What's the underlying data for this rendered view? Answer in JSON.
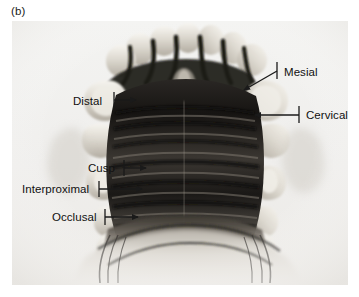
{
  "figure": {
    "panel_label": "(b)",
    "view_description": "occlusal view of dental arch specimen",
    "frame": {
      "x": 12,
      "y": 21,
      "width": 336,
      "height": 264,
      "background": "#f1f1ef"
    }
  },
  "colors": {
    "page_background": "#ffffff",
    "image_background": "#f1f1ef",
    "annotation_line": "#1a1a1a",
    "text": "#101010",
    "enamel_light": "#e8e5de",
    "enamel_mid": "#c8c3b8",
    "shadow_dark": "#1d1b18",
    "mid_tone": "#6e6a63"
  },
  "callouts": [
    {
      "id": "distal",
      "label": "Distal",
      "text_x": 73,
      "text_y": 95,
      "align": "left",
      "tick": {
        "x": 114,
        "y1": 92,
        "y2": 108
      },
      "arrow": {
        "x1": 114,
        "y1": 100,
        "x2": 142,
        "y2": 100
      },
      "arrow_direction": "right"
    },
    {
      "id": "mesial",
      "label": "Mesial",
      "text_x": 284,
      "text_y": 66,
      "align": "left",
      "tick": {
        "x": 277,
        "y1": 62,
        "y2": 79
      },
      "arrow": {
        "x1": 277,
        "y1": 71,
        "x2": 238,
        "y2": 93
      },
      "arrow_direction": "down-left"
    },
    {
      "id": "cervical",
      "label": "Cervical",
      "text_x": 306,
      "text_y": 109,
      "align": "left",
      "tick": {
        "x": 299,
        "y1": 106,
        "y2": 123
      },
      "arrow": {
        "x1": 299,
        "y1": 115,
        "x2": 249,
        "y2": 115
      },
      "arrow_direction": "left"
    },
    {
      "id": "cusp",
      "label": "Cusp",
      "text_x": 88,
      "text_y": 162,
      "align": "left",
      "tick": {
        "x": 124,
        "y1": 160,
        "y2": 176
      },
      "arrow": {
        "x1": 124,
        "y1": 168,
        "x2": 152,
        "y2": 168
      },
      "arrow_direction": "right"
    },
    {
      "id": "interproximal",
      "label": "Interproximal",
      "text_x": 22,
      "text_y": 183,
      "align": "left",
      "tick": {
        "x": 99,
        "y1": 181,
        "y2": 197
      },
      "arrow": {
        "x1": 99,
        "y1": 189,
        "x2": 148,
        "y2": 189
      },
      "arrow_direction": "right"
    },
    {
      "id": "occlusal",
      "label": "Occlusal",
      "text_x": 52,
      "text_y": 211,
      "align": "left",
      "tick": {
        "x": 105,
        "y1": 209,
        "y2": 225
      },
      "arrow": {
        "x1": 105,
        "y1": 217,
        "x2": 144,
        "y2": 217
      },
      "arrow_direction": "right"
    }
  ]
}
